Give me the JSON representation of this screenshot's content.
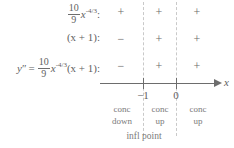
{
  "chart_data": {
    "type": "table",
    "title": "",
    "subtitle": "",
    "xlabel": "x",
    "ylabel": "",
    "grid": false,
    "legend": "none",
    "axis_ticks": [
      "-1",
      "0"
    ],
    "axis_tick_values": [
      -1,
      0
    ],
    "intervals": [
      "x < -1",
      "-1 < x < 0",
      "x > 0"
    ],
    "row_labels": [
      "(10/9)x^(-4/3) :",
      "(x + 1) :",
      "y'' = (10/9)x^(-4/3)(x + 1) :"
    ],
    "series": [
      {
        "name": "(10/9)x^(-4/3)",
        "values": [
          "+",
          "+",
          "+"
        ]
      },
      {
        "name": "(x + 1)",
        "values": [
          "-",
          "+",
          "+"
        ]
      },
      {
        "name": "y''",
        "values": [
          "-",
          "+",
          "+"
        ]
      }
    ],
    "concavity": [
      "conc down",
      "conc up",
      "conc up"
    ],
    "annotations": [
      "infl point"
    ]
  },
  "rows": {
    "row1": {
      "coefficient_numerator": "10",
      "coefficient_denominator": "9",
      "variable": "x",
      "exponent": "-4/3",
      "colon": ":",
      "signs": [
        "+",
        "+",
        "+"
      ]
    },
    "row2": {
      "expression": "(x + 1)",
      "colon": ":",
      "signs": [
        "−",
        "+",
        "+"
      ]
    },
    "row3": {
      "lhs": "y",
      "prime": "″",
      "equals": "=",
      "coefficient_numerator": "10",
      "coefficient_denominator": "9",
      "variable": "x",
      "exponent": "-4/3",
      "factor": "(x + 1)",
      "colon": ":",
      "signs": [
        "−",
        "+",
        "+"
      ]
    }
  },
  "axis": {
    "label": "x",
    "ticks": [
      {
        "label": "−1"
      },
      {
        "label": "0"
      }
    ]
  },
  "concavity": [
    {
      "line1": "conc",
      "line2": "down"
    },
    {
      "line1": "conc",
      "line2": "up"
    },
    {
      "line1": "conc",
      "line2": "up"
    }
  ],
  "footer": {
    "infl_label": "infl point"
  },
  "colors": {
    "text": "#6d6d6d",
    "axis": "#6d6d6d",
    "divider": "#c9c9c9",
    "background": "#ffffff"
  }
}
